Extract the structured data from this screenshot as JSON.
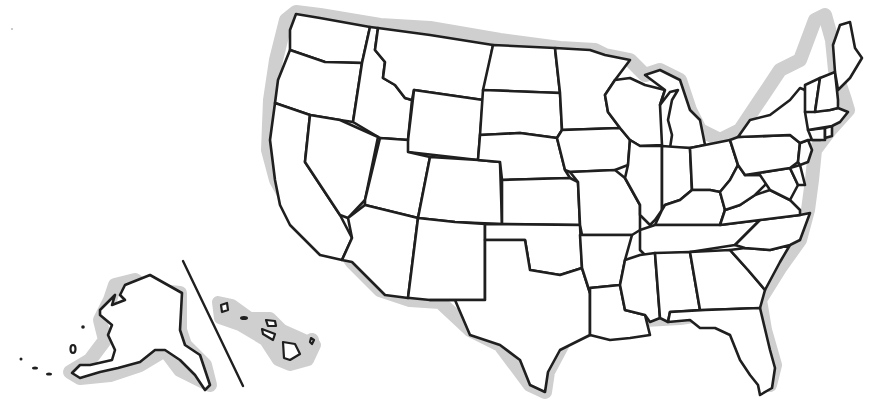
{
  "map": {
    "type": "outline",
    "subject": "United States — state boundaries (blank)",
    "colors": {
      "background": "#ffffff",
      "land_fill": "#ffffff",
      "border": "#1f1f1f",
      "coast_shadow": "#cfcfcf"
    },
    "insets": [
      "Alaska",
      "Hawaii"
    ],
    "states": [
      {
        "id": "WA",
        "name": "Washington"
      },
      {
        "id": "OR",
        "name": "Oregon"
      },
      {
        "id": "CA",
        "name": "California"
      },
      {
        "id": "ID",
        "name": "Idaho"
      },
      {
        "id": "NV",
        "name": "Nevada"
      },
      {
        "id": "MT",
        "name": "Montana"
      },
      {
        "id": "WY",
        "name": "Wyoming"
      },
      {
        "id": "UT",
        "name": "Utah"
      },
      {
        "id": "AZ",
        "name": "Arizona"
      },
      {
        "id": "CO",
        "name": "Colorado"
      },
      {
        "id": "NM",
        "name": "New Mexico"
      },
      {
        "id": "ND",
        "name": "North Dakota"
      },
      {
        "id": "SD",
        "name": "South Dakota"
      },
      {
        "id": "NE",
        "name": "Nebraska"
      },
      {
        "id": "KS",
        "name": "Kansas"
      },
      {
        "id": "OK",
        "name": "Oklahoma"
      },
      {
        "id": "TX",
        "name": "Texas"
      },
      {
        "id": "MN",
        "name": "Minnesota"
      },
      {
        "id": "IA",
        "name": "Iowa"
      },
      {
        "id": "MO",
        "name": "Missouri"
      },
      {
        "id": "AR",
        "name": "Arkansas"
      },
      {
        "id": "LA",
        "name": "Louisiana"
      },
      {
        "id": "WI",
        "name": "Wisconsin"
      },
      {
        "id": "IL",
        "name": "Illinois"
      },
      {
        "id": "MI",
        "name": "Michigan"
      },
      {
        "id": "IN",
        "name": "Indiana"
      },
      {
        "id": "OH",
        "name": "Ohio"
      },
      {
        "id": "KY",
        "name": "Kentucky"
      },
      {
        "id": "TN",
        "name": "Tennessee"
      },
      {
        "id": "MS",
        "name": "Mississippi"
      },
      {
        "id": "AL",
        "name": "Alabama"
      },
      {
        "id": "GA",
        "name": "Georgia"
      },
      {
        "id": "FL",
        "name": "Florida"
      },
      {
        "id": "SC",
        "name": "South Carolina"
      },
      {
        "id": "NC",
        "name": "North Carolina"
      },
      {
        "id": "VA",
        "name": "Virginia"
      },
      {
        "id": "WV",
        "name": "West Virginia"
      },
      {
        "id": "PA",
        "name": "Pennsylvania"
      },
      {
        "id": "NY",
        "name": "New York"
      },
      {
        "id": "VT",
        "name": "Vermont"
      },
      {
        "id": "NH",
        "name": "New Hampshire"
      },
      {
        "id": "ME",
        "name": "Maine"
      },
      {
        "id": "MA",
        "name": "Massachusetts"
      },
      {
        "id": "CT",
        "name": "Connecticut"
      },
      {
        "id": "RI",
        "name": "Rhode Island"
      },
      {
        "id": "NJ",
        "name": "New Jersey"
      },
      {
        "id": "DE",
        "name": "Delaware"
      },
      {
        "id": "MD",
        "name": "Maryland"
      },
      {
        "id": "AK",
        "name": "Alaska"
      },
      {
        "id": "HI",
        "name": "Hawaii"
      }
    ]
  }
}
